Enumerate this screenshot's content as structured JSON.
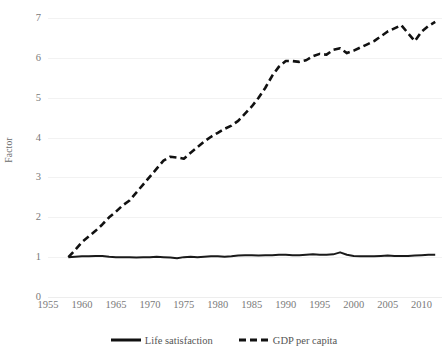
{
  "chart_data": {
    "type": "line",
    "title": "",
    "xlabel": "",
    "ylabel": "Factor",
    "xlim": [
      1955,
      2013
    ],
    "ylim": [
      0,
      7
    ],
    "ytick_labels": [
      "0",
      "1",
      "2",
      "3",
      "4",
      "5",
      "6",
      "7"
    ],
    "ytick_values": [
      0,
      1,
      2,
      3,
      4,
      5,
      6,
      7
    ],
    "xtick_labels": [
      "1955",
      "1960",
      "1965",
      "1970",
      "1975",
      "1980",
      "1985",
      "1990",
      "1995",
      "2000",
      "2005",
      "2010"
    ],
    "xtick_values": [
      1955,
      1960,
      1965,
      1970,
      1975,
      1980,
      1985,
      1990,
      1995,
      2000,
      2005,
      2010
    ],
    "grid": true,
    "grid_color": "#f2f2f2",
    "legend_position": "bottom",
    "x": [
      1958,
      1959,
      1960,
      1961,
      1962,
      1963,
      1964,
      1965,
      1966,
      1967,
      1968,
      1969,
      1970,
      1971,
      1972,
      1973,
      1974,
      1975,
      1976,
      1977,
      1978,
      1979,
      1980,
      1981,
      1982,
      1983,
      1984,
      1985,
      1986,
      1987,
      1988,
      1989,
      1990,
      1991,
      1992,
      1993,
      1994,
      1995,
      1996,
      1997,
      1998,
      1999,
      2000,
      2001,
      2002,
      2003,
      2004,
      2005,
      2006,
      2007,
      2008,
      2009,
      2010,
      2011,
      2012
    ],
    "series": [
      {
        "name": "Life satisfaction",
        "style": "solid",
        "color": "#1a1a1a",
        "values": [
          1.0,
          1.01,
          1.02,
          1.02,
          1.03,
          1.03,
          1.01,
          1.0,
          1.0,
          1.0,
          0.99,
          1.0,
          1.0,
          1.01,
          1.0,
          0.99,
          0.97,
          1.0,
          1.01,
          1.0,
          1.01,
          1.02,
          1.02,
          1.01,
          1.02,
          1.04,
          1.05,
          1.05,
          1.04,
          1.05,
          1.05,
          1.06,
          1.06,
          1.05,
          1.05,
          1.06,
          1.07,
          1.06,
          1.06,
          1.07,
          1.12,
          1.06,
          1.03,
          1.02,
          1.02,
          1.02,
          1.03,
          1.04,
          1.03,
          1.03,
          1.03,
          1.04,
          1.05,
          1.06,
          1.06
        ]
      },
      {
        "name": "GDP per capita",
        "style": "dashed",
        "color": "#111111",
        "values": [
          1.0,
          1.18,
          1.38,
          1.52,
          1.66,
          1.82,
          2.0,
          2.14,
          2.3,
          2.42,
          2.62,
          2.82,
          3.02,
          3.22,
          3.42,
          3.52,
          3.5,
          3.47,
          3.62,
          3.76,
          3.9,
          4.02,
          4.12,
          4.22,
          4.3,
          4.42,
          4.6,
          4.78,
          5.0,
          5.25,
          5.55,
          5.78,
          5.92,
          5.92,
          5.9,
          5.94,
          6.04,
          6.1,
          6.08,
          6.2,
          6.24,
          6.12,
          6.18,
          6.26,
          6.34,
          6.42,
          6.54,
          6.66,
          6.74,
          6.82,
          6.62,
          6.42,
          6.66,
          6.8,
          6.9
        ]
      }
    ]
  },
  "legend": {
    "items": [
      {
        "label": "Life satisfaction",
        "style": "solid"
      },
      {
        "label": "GDP per capita",
        "style": "dashed"
      }
    ]
  },
  "axis": {
    "y_title": "Factor"
  }
}
